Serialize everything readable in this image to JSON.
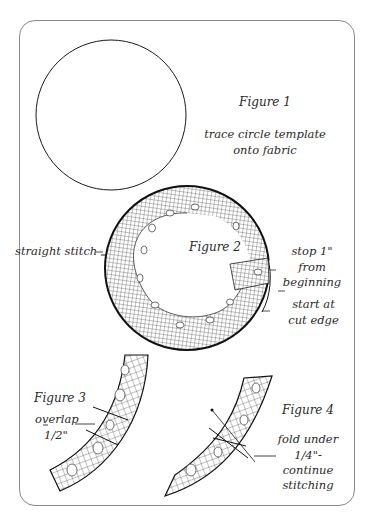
{
  "figures": [
    {
      "id": "figure-1",
      "title": "Figure 1",
      "caption_lines": [
        "trace circle template",
        "onto fabric"
      ]
    },
    {
      "id": "figure-2",
      "title": "Figure 2",
      "callouts": [
        {
          "text": "straight stitch"
        },
        {
          "lines": [
            "stop 1\"",
            "from",
            "beginning"
          ]
        },
        {
          "lines": [
            "start at",
            "cut edge"
          ]
        }
      ]
    },
    {
      "id": "figure-3",
      "title": "Figure 3",
      "callout_lines": [
        "overlap",
        "1/2\""
      ]
    },
    {
      "id": "figure-4",
      "title": "Figure 4",
      "callout_lines": [
        "fold under",
        "1/4\"-",
        "continue",
        "stitching"
      ]
    }
  ],
  "colors": {
    "ink": "#1a1a1a",
    "frame": "#8a8a8a",
    "background": "#ffffff"
  }
}
